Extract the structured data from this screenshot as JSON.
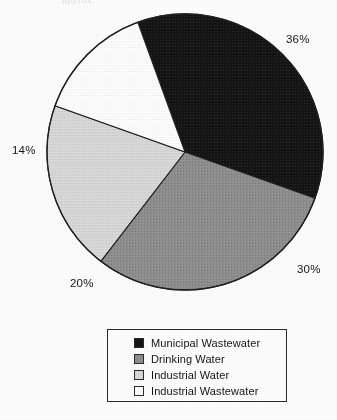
{
  "title_artifact": "approx.",
  "chart_data": {
    "type": "pie",
    "title": "",
    "xlabel": "",
    "ylabel": "",
    "categories": [
      "Municipal Wastewater",
      "Drinking Water",
      "Industrial Water",
      "Industrial Wastewater"
    ],
    "values": [
      36,
      30,
      20,
      14
    ],
    "value_unit": "%",
    "data_labels": [
      "36%",
      "30%",
      "20%",
      "14%"
    ],
    "colors": [
      "#141414",
      "#8f8f8f",
      "#d9d9d9",
      "#ffffff"
    ],
    "start_angle_deg": -20,
    "direction": "clockwise",
    "legend_position": "bottom",
    "grid": false,
    "total": 100
  },
  "pie": {
    "center_x": 185,
    "center_y": 152,
    "radius": 138,
    "stroke": "#1f1f1f",
    "slices": [
      {
        "label": "Municipal Wastewater",
        "percent": 36,
        "data_label": "36%",
        "color": "#141414"
      },
      {
        "label": "Drinking Water",
        "percent": 30,
        "data_label": "30%",
        "color": "#8f8f8f"
      },
      {
        "label": "Industrial Water",
        "percent": 20,
        "data_label": "20%",
        "color": "#d9d9d9"
      },
      {
        "label": "Industrial Wastewater",
        "percent": 14,
        "data_label": "14%",
        "color": "#ffffff"
      }
    ]
  },
  "legend": {
    "items": [
      {
        "label": "Municipal Wastewater",
        "color": "#141414"
      },
      {
        "label": "Drinking Water",
        "color": "#8f8f8f"
      },
      {
        "label": "Industrial Water",
        "color": "#d9d9d9"
      },
      {
        "label": "Industrial Wastewater",
        "color": "#ffffff"
      }
    ]
  }
}
